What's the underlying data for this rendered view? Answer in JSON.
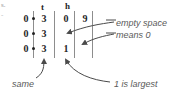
{
  "diagram": {
    "title_fragment": "s.",
    "title_fragment2": "-",
    "headers": {
      "tens": "t",
      "hundreds": "h"
    },
    "rows": [
      {
        "left": "0",
        "tens": "3",
        "hundreds": "0",
        "extra": "9"
      },
      {
        "left": "0",
        "tens": "3",
        "hundreds": "",
        "extra": ""
      },
      {
        "left": "0",
        "tens": "3",
        "hundreds": "1",
        "extra": ""
      }
    ],
    "annotations": [
      {
        "name": "empty-space-note",
        "line1": "empty space",
        "line2": "means 0"
      },
      {
        "name": "same-note",
        "text": "same"
      },
      {
        "name": "largest-note",
        "text": "1 is largest"
      }
    ],
    "colors": {
      "ink": "#1f1f1f",
      "rule": "#8d8d8d",
      "note": "#5a5a5a",
      "background": "#ffffff"
    }
  }
}
